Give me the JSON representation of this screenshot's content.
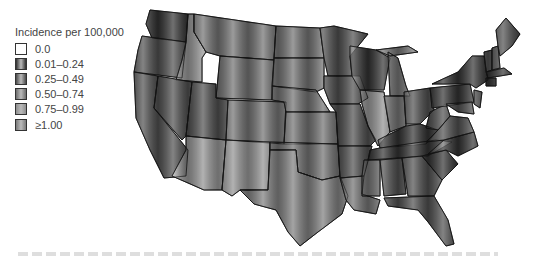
{
  "legend": {
    "title": "Incidence per 100,000",
    "items": [
      {
        "label": "0.0",
        "color": "#ffffff",
        "key": "c0"
      },
      {
        "label": "0.01–0.24",
        "color": "#2e2e2e",
        "key": "c1"
      },
      {
        "label": "0.25–0.49",
        "color": "#4a4a4a",
        "key": "c2"
      },
      {
        "label": "0.50–0.74",
        "color": "#6c6c6c",
        "key": "c3"
      },
      {
        "label": "0.75–0.99",
        "color": "#8e8e8e",
        "key": "c4"
      },
      {
        "label": "≥1.00",
        "color": "#7a7a7a",
        "key": "c5"
      }
    ]
  },
  "map": {
    "title": "Incidence per 100,000 by state",
    "states": [
      {
        "id": "WA",
        "cls": "c1",
        "d": "M22,10 L60,14 L58,42 L24,38 L18,24 Z"
      },
      {
        "id": "OR",
        "cls": "c2",
        "d": "M14,36 L58,42 L54,78 L6,72 L10,50 Z"
      },
      {
        "id": "CA",
        "cls": "c2",
        "d": "M6,72 L30,76 L26,108 L60,150 L58,176 L36,178 L22,150 L8,118 Z"
      },
      {
        "id": "ID",
        "cls": "c4",
        "d": "M60,14 L66,14 L66,32 L78,52 L74,58 L74,82 L48,80 L54,60 L58,42 Z"
      },
      {
        "id": "NV",
        "cls": "c2",
        "d": "M30,76 L64,82 L58,136 L54,140 L26,108 Z"
      },
      {
        "id": "MT",
        "cls": "c3",
        "d": "M66,14 L148,26 L146,60 L92,56 L78,52 L66,32 Z"
      },
      {
        "id": "WY",
        "cls": "c3",
        "d": "M92,56 L146,60 L144,100 L88,98 Z"
      },
      {
        "id": "UT",
        "cls": "c2",
        "d": "M64,82 L88,84 L88,98 L100,100 L98,140 L58,136 Z"
      },
      {
        "id": "AZ",
        "cls": "c4",
        "d": "M58,136 L98,140 L94,190 L76,190 L44,176 L58,150 Z"
      },
      {
        "id": "CO",
        "cls": "c3",
        "d": "M100,100 L158,102 L156,144 L98,140 Z"
      },
      {
        "id": "NM",
        "cls": "c4",
        "d": "M98,140 L142,142 L140,190 L112,190 L104,196 L94,190 Z"
      },
      {
        "id": "ND",
        "cls": "c3",
        "d": "M148,26 L192,28 L196,58 L146,58 Z"
      },
      {
        "id": "SD",
        "cls": "c3",
        "d": "M146,58 L196,58 L196,88 L188,92 L144,86 Z"
      },
      {
        "id": "NE",
        "cls": "c3",
        "d": "M144,86 L188,90 L202,112 L158,112 L156,102 L144,100 Z"
      },
      {
        "id": "KS",
        "cls": "c3",
        "d": "M158,112 L208,112 L210,144 L156,144 Z"
      },
      {
        "id": "OK",
        "cls": "c3",
        "d": "M142,142 L210,144 L212,176 L194,180 L170,172 L168,150 L142,150 Z"
      },
      {
        "id": "TX",
        "cls": "c5",
        "d": "M112,190 L140,190 L142,150 L168,150 L170,172 L194,180 L212,176 L220,196 L214,214 L190,232 L172,246 L160,232 L148,210 L126,204 Z"
      },
      {
        "id": "MN",
        "cls": "c2",
        "d": "M192,28 L206,26 L240,34 L222,56 L224,76 L200,76 L196,58 Z"
      },
      {
        "id": "IA",
        "cls": "c2",
        "d": "M196,76 L232,76 L240,98 L230,104 L202,104 L196,88 Z"
      },
      {
        "id": "MO",
        "cls": "c2",
        "d": "M202,104 L232,104 L240,126 L248,140 L242,146 L210,146 L208,112 Z"
      },
      {
        "id": "AR",
        "cls": "c2",
        "d": "M210,146 L244,146 L236,176 L212,178 Z"
      },
      {
        "id": "LA",
        "cls": "c3",
        "d": "M212,178 L236,176 L234,194 L252,200 L248,214 L226,210 L218,200 Z"
      },
      {
        "id": "WI",
        "cls": "c1",
        "d": "M222,46 L248,50 L262,58 L256,90 L232,90 L224,76 L222,56 Z"
      },
      {
        "id": "IL",
        "cls": "c4",
        "d": "M232,90 L256,92 L262,132 L250,146 L240,126 L234,104 Z"
      },
      {
        "id": "MI",
        "cls": "c3",
        "d": "M260,52 L270,58 L278,86 L282,96 L262,96 Z M248,50 L280,46 L290,52 L262,56 Z"
      },
      {
        "id": "IN",
        "cls": "c3",
        "d": "M256,96 L276,96 L278,126 L262,132 Z"
      },
      {
        "id": "OH",
        "cls": "c2",
        "d": "M276,92 L302,88 L306,110 L292,124 L278,124 Z"
      },
      {
        "id": "KY",
        "cls": "c1",
        "d": "M250,140 L278,126 L292,124 L310,130 L298,144 L252,148 Z"
      },
      {
        "id": "TN",
        "cls": "c1",
        "d": "M242,150 L252,148 L308,140 L324,142 L300,156 L240,160 Z"
      },
      {
        "id": "MS",
        "cls": "c3",
        "d": "M236,160 L252,160 L252,196 L234,196 L234,176 Z"
      },
      {
        "id": "AL",
        "cls": "c2",
        "d": "M252,160 L274,158 L278,194 L256,196 Z"
      },
      {
        "id": "GA",
        "cls": "c2",
        "d": "M274,158 L294,156 L314,180 L306,196 L280,196 Z"
      },
      {
        "id": "FL",
        "cls": "c2",
        "d": "M256,198 L306,196 L320,220 L326,244 L318,246 L300,222 L290,210 L260,206 Z"
      },
      {
        "id": "SC",
        "cls": "c1",
        "d": "M294,156 L318,150 L330,164 L314,180 Z"
      },
      {
        "id": "NC",
        "cls": "c1",
        "d": "M300,154 L316,140 L346,132 L350,146 L330,156 L318,150 Z"
      },
      {
        "id": "VA",
        "cls": "c2",
        "d": "M298,142 L310,130 L322,116 L340,118 L346,132 L316,140 Z"
      },
      {
        "id": "WV",
        "cls": "c2",
        "d": "M302,112 L318,104 L322,116 L310,130 L298,128 Z"
      },
      {
        "id": "PA",
        "cls": "c1",
        "d": "M302,88 L342,84 L346,102 L304,108 Z"
      },
      {
        "id": "NY",
        "cls": "c1",
        "d": "M304,84 L330,72 L344,56 L356,56 L360,80 L348,88 L342,84 Z"
      },
      {
        "id": "VT",
        "cls": "c2",
        "d": "M356,52 L364,50 L364,70 L358,72 Z"
      },
      {
        "id": "NH",
        "cls": "c2",
        "d": "M364,48 L370,46 L372,68 L364,70 Z"
      },
      {
        "id": "ME",
        "cls": "c2",
        "d": "M368,30 L378,18 L392,34 L384,46 L372,56 L370,46 Z"
      },
      {
        "id": "MA",
        "cls": "c1",
        "d": "M358,72 L376,68 L384,74 L360,78 Z"
      },
      {
        "id": "CT",
        "cls": "c1",
        "d": "M358,78 L368,78 L368,86 L358,86 Z"
      },
      {
        "id": "NJ",
        "cls": "c2",
        "d": "M346,90 L354,92 L352,108 L346,104 Z"
      },
      {
        "id": "MD",
        "cls": "c2",
        "d": "M318,104 L344,102 L346,114 L330,112 Z"
      }
    ]
  },
  "caption": {
    "visible": "faint cut-off caption text (illegible)"
  }
}
